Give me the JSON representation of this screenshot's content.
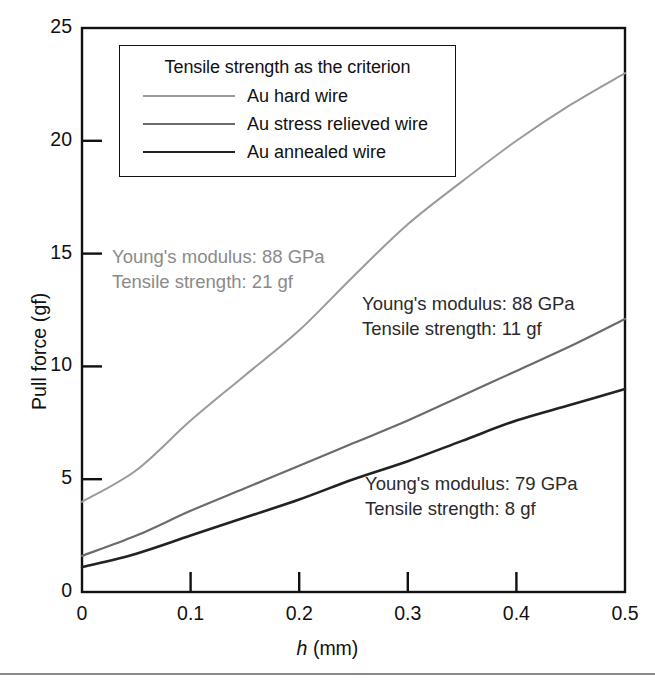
{
  "figure": {
    "background": "#ffffff",
    "bottom_rule_color": "#8b8b8b"
  },
  "axes": {
    "x_label_italic": "h",
    "x_label_unit": " (mm)",
    "y_label": "Pull force (gf)",
    "x_ticks": [
      "0",
      "0.1",
      "0.2",
      "0.3",
      "0.4",
      "0.5"
    ],
    "y_ticks": [
      "0",
      "5",
      "10",
      "15",
      "20",
      "25"
    ],
    "frame_color": "#111111"
  },
  "legend": {
    "title": "Tensile strength as the criterion",
    "entries": [
      {
        "label": "Au hard wire",
        "color": "#9a9a9a",
        "width": 2.0
      },
      {
        "label": "Au stress relieved wire",
        "color": "#6b6b6b",
        "width": 2.2
      },
      {
        "label": "Au annealed wire",
        "color": "#222222",
        "width": 2.6
      }
    ]
  },
  "annotations": [
    {
      "id": "annot-hard",
      "line1": "Young's modulus: 88 GPa",
      "line2": "Tensile strength: 21 gf",
      "color": "#8a8a8a"
    },
    {
      "id": "annot-stress",
      "line1": "Young's modulus: 88 GPa",
      "line2": "Tensile strength: 11 gf",
      "color": "#2a2a2a"
    },
    {
      "id": "annot-anneal",
      "line1": "Young's modulus: 79 GPa",
      "line2": "Tensile strength: 8 gf",
      "color": "#2a2a2a"
    }
  ],
  "chart_data": {
    "type": "line",
    "title": "",
    "xlabel": "h (mm)",
    "ylabel": "Pull force (gf)",
    "xlim": [
      0,
      0.5
    ],
    "ylim": [
      0,
      25
    ],
    "grid": false,
    "legend_position": "top-left-inside",
    "x": [
      0.0,
      0.05,
      0.1,
      0.15,
      0.2,
      0.25,
      0.3,
      0.35,
      0.4,
      0.45,
      0.5
    ],
    "series": [
      {
        "name": "Au hard wire",
        "color": "#9a9a9a",
        "values": [
          4.0,
          5.4,
          7.6,
          9.6,
          11.6,
          14.0,
          16.3,
          18.2,
          20.0,
          21.6,
          23.0
        ],
        "youngs_modulus_GPa": 88,
        "tensile_strength_gf": 21
      },
      {
        "name": "Au stress relieved wire",
        "color": "#6b6b6b",
        "values": [
          1.6,
          2.5,
          3.6,
          4.6,
          5.6,
          6.6,
          7.6,
          8.7,
          9.8,
          10.9,
          12.1
        ],
        "youngs_modulus_GPa": 88,
        "tensile_strength_gf": 11
      },
      {
        "name": "Au annealed wire",
        "color": "#222222",
        "values": [
          1.1,
          1.7,
          2.5,
          3.3,
          4.1,
          5.0,
          5.8,
          6.7,
          7.6,
          8.3,
          9.0
        ],
        "youngs_modulus_GPa": 79,
        "tensile_strength_gf": 8
      }
    ]
  }
}
